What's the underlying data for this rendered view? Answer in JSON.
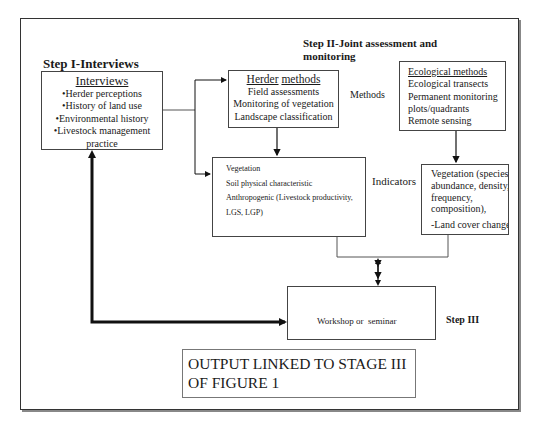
{
  "diagram": {
    "step1": {
      "heading": "Step I-Interviews",
      "box_title": "Interviews",
      "items": [
        "•Herder perceptions",
        "•History of land use",
        "•Environmental history",
        "•Livestock management",
        "practice"
      ]
    },
    "step2": {
      "heading_line1": "Step II-Joint assessment and",
      "heading_line2": "monitoring",
      "methods_label": "Methods",
      "indicators_label": "Indicators",
      "herder_methods": {
        "title_word1": "Herder",
        "title_word2": "methods",
        "items": [
          "Field assessments",
          "Monitoring of vegetation",
          "Landscape classification"
        ]
      },
      "ecological_methods": {
        "title": "Ecological methods",
        "items": [
          "Ecological transects",
          "Permanent monitoring",
          "plots/quadrants",
          "Remote sensing"
        ]
      },
      "herder_indicators": {
        "items": [
          "Vegetation",
          "Soil physical characteristic",
          "Anthropogenic (Livestock productivity,",
          "LGS, LGP)"
        ]
      },
      "ecological_indicators": {
        "items": [
          "Vegetation (species",
          "abundance, density,",
          "frequency,",
          "composition),"
        ],
        "extra": "-Land cover change"
      }
    },
    "step3": {
      "heading": "Step III",
      "box_text": "Workshop or  seminar"
    },
    "output": {
      "line1": "OUTPUT LINKED TO STAGE III",
      "line2": "OF FIGURE 1"
    }
  }
}
